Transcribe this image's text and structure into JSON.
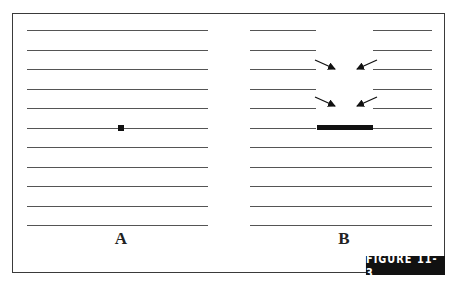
{
  "figure": {
    "caption_badge": "FIGURE 11-3",
    "panels": [
      {
        "label": "A",
        "description": "Eleven horizontal lines with a small square dot on the sixth line"
      },
      {
        "label": "B",
        "description": "Eleven horizontal lines split by a gap; arrows point inward; a thick bar spans the gap on the sixth line"
      }
    ],
    "line_count": 11,
    "colors": {
      "line": "#555555",
      "mark": "#111111",
      "badge_bg": "#111111",
      "badge_text": "#ffffff"
    }
  }
}
